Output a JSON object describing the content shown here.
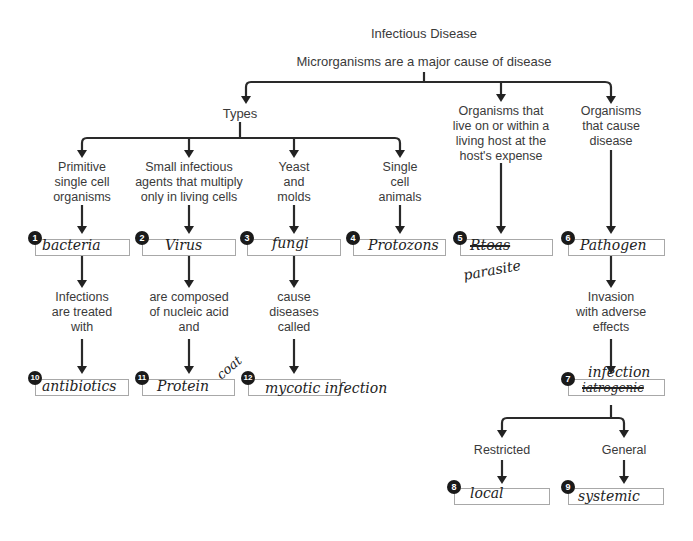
{
  "title": "Infectious Disease",
  "root": "Microrganisms are a major cause of disease",
  "types_label": "Types",
  "branches": {
    "parasite_desc": [
      "Organisms that",
      "live on or within a",
      "living host at the",
      "host's expense"
    ],
    "pathogen_desc": [
      "Organisms",
      "that cause",
      "disease"
    ]
  },
  "types": [
    {
      "desc": [
        "Primitive",
        "single cell",
        "organisms"
      ]
    },
    {
      "desc": [
        "Small infectious",
        "agents that multiply",
        "only in living cells"
      ]
    },
    {
      "desc": [
        "Yeast",
        "and",
        "molds"
      ]
    },
    {
      "desc": [
        "Single",
        "cell",
        "animals"
      ]
    }
  ],
  "second_level": [
    {
      "desc": [
        "Infections",
        "are treated",
        "with"
      ]
    },
    {
      "desc": [
        "are composed",
        "of nucleic acid",
        "and"
      ]
    },
    {
      "desc": [
        "cause",
        "diseases",
        "called"
      ]
    }
  ],
  "invasion": [
    "Invasion",
    "with adverse",
    "effects"
  ],
  "restricted": "Restricted",
  "general": "General",
  "answers": {
    "1": {
      "num": "1",
      "text": "bacteria"
    },
    "2": {
      "num": "2",
      "text": "Virus"
    },
    "3": {
      "num": "3",
      "text": "fungi"
    },
    "4": {
      "num": "4",
      "text": "Protozons"
    },
    "5": {
      "num": "5",
      "struck": "Rtoas",
      "text": "parasite"
    },
    "6": {
      "num": "6",
      "text": "Pathogen"
    },
    "7": {
      "num": "7",
      "text": "infection",
      "struck": "iatrogenic"
    },
    "8": {
      "num": "8",
      "text": "local"
    },
    "9": {
      "num": "9",
      "text": "systemic"
    },
    "10": {
      "num": "10",
      "text": "antibiotics"
    },
    "11": {
      "num": "11",
      "text": "Protein",
      "extra": "coat"
    },
    "12": {
      "num": "12",
      "text": "mycotic infection"
    }
  }
}
